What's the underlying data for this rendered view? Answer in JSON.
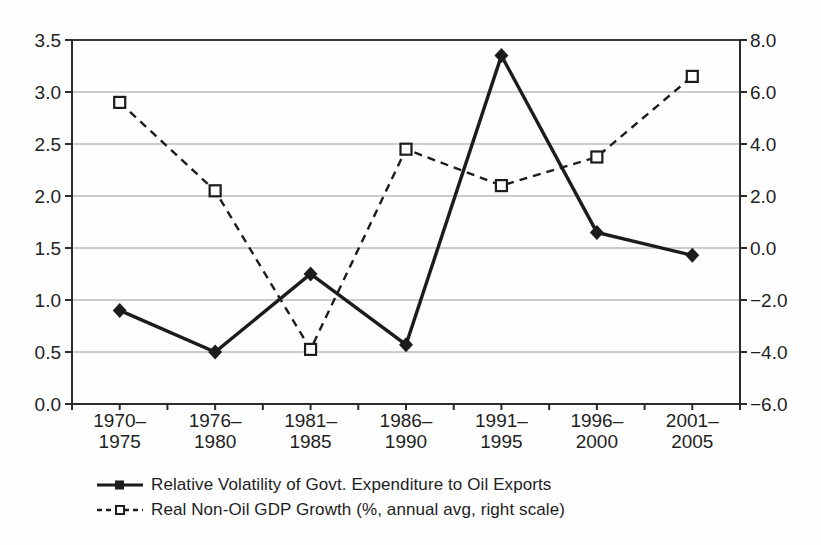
{
  "chart_data": {
    "type": "line",
    "categories": [
      "1970–\n1975",
      "1976–\n1980",
      "1981–\n1985",
      "1986–\n1990",
      "1991–\n1995",
      "1996–\n2000",
      "2001–\n2005"
    ],
    "series": [
      {
        "name": "Relative Volatility of Govt. Expenditure to Oil Exports",
        "axis": "left",
        "line_style": "solid",
        "marker": "filled-diamond",
        "legend_marker": "filled-square",
        "color": "#1c1c1c",
        "values": [
          0.9,
          0.5,
          1.25,
          0.57,
          3.35,
          1.65,
          1.43
        ]
      },
      {
        "name": "Real Non-Oil GDP Growth (%, annual avg, right scale)",
        "axis": "right",
        "line_style": "dashed",
        "marker": "open-square",
        "legend_marker": "open-square",
        "color": "#1c1c1c",
        "values": [
          5.6,
          2.2,
          -3.9,
          3.8,
          2.4,
          3.5,
          6.6
        ]
      }
    ],
    "left_axis": {
      "min": 0,
      "max": 3.5,
      "ticks": [
        "3.5",
        "3.0",
        "2.5",
        "2.0",
        "1.5",
        "1.0",
        "0.5",
        "0.0"
      ]
    },
    "right_axis": {
      "min": -6,
      "max": 8,
      "ticks": [
        "8.0",
        "6.0",
        "4.0",
        "2.0",
        "0.0",
        "-2.0",
        "-4.0",
        "-6.0"
      ]
    },
    "grid": true,
    "grid_color": "#9b9b9b",
    "top_gridline_color": "#3c3c3c",
    "axis_color": "#2b2b2b",
    "legend_position": "bottom-left"
  }
}
